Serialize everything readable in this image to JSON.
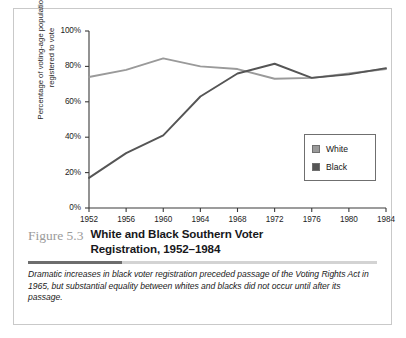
{
  "figure": {
    "number_label": "Figure 5.3",
    "title_line1": "White and Black Southern Voter",
    "title_line2": "Registration, 1952–1984",
    "caption": "Dramatic increases in black voter registration preceded passage of the Voting Rights Act in 1965, but substantial equality between whites and blacks did not occur until after its passage."
  },
  "legend": {
    "items": [
      {
        "label": "White",
        "color": "#9a9a9a"
      },
      {
        "label": "Black",
        "color": "#555555"
      }
    ]
  },
  "axis": {
    "ylabel_line1": "Percentage of voting-age population",
    "ylabel_line2": "registered to vote",
    "yticks": [
      "0%",
      "20%",
      "40%",
      "60%",
      "80%",
      "100%"
    ],
    "xticks": [
      "1952",
      "1956",
      "1960",
      "1964",
      "1968",
      "1972",
      "1976",
      "1980",
      "1984"
    ]
  },
  "chart_data": {
    "type": "line",
    "title": "White and Black Southern Voter Registration, 1952–1984",
    "xlabel": "",
    "ylabel": "Percentage of voting-age population registered to vote",
    "categories": [
      1952,
      1956,
      1960,
      1964,
      1968,
      1972,
      1976,
      1980,
      1984
    ],
    "xlim": [
      1952,
      1984
    ],
    "ylim": [
      0,
      100
    ],
    "ytick_values": [
      0,
      20,
      40,
      60,
      80,
      100
    ],
    "ytick_labels": [
      "0%",
      "20%",
      "40%",
      "60%",
      "80%",
      "100%"
    ],
    "grid": false,
    "legend_position": "right-middle",
    "series": [
      {
        "name": "White",
        "color": "#9a9a9a",
        "values": [
          74,
          78,
          84.5,
          80,
          78.5,
          73,
          73.5,
          76,
          78.5
        ]
      },
      {
        "name": "Black",
        "color": "#555555",
        "values": [
          17,
          31,
          41,
          63,
          76,
          81.5,
          73.5,
          75.5,
          79
        ]
      }
    ]
  }
}
